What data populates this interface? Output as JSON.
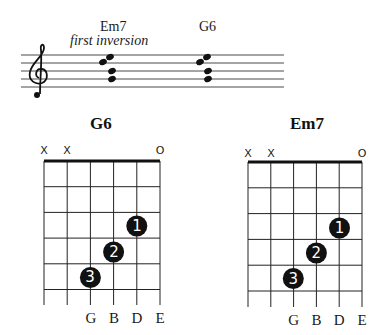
{
  "staff": {
    "chords": [
      {
        "name": "Em7",
        "subtitle": "first inversion",
        "x": 100
      },
      {
        "name": "G6",
        "subtitle": "",
        "x": 199
      }
    ],
    "clef": "treble-clef",
    "line_ys": [
      55,
      63,
      71,
      79,
      87
    ],
    "x_start": 21,
    "x_end": 284
  },
  "diagrams": [
    {
      "title": "G6",
      "left": 44,
      "top": 161,
      "col_width": 23.2,
      "fret_height": 25.7,
      "frets": 5,
      "string_marks": [
        "X",
        "X",
        "",
        "",
        "",
        "O"
      ],
      "fingers": [
        {
          "string": 4,
          "fret": 3,
          "finger": "1"
        },
        {
          "string": 3,
          "fret": 4,
          "finger": "2"
        },
        {
          "string": 2,
          "fret": 5,
          "finger": "3"
        }
      ],
      "string_labels": [
        "",
        "",
        "G",
        "B",
        "D",
        "E"
      ]
    },
    {
      "title": "Em7",
      "left": 248,
      "top": 162,
      "col_width": 22.8,
      "fret_height": 25.8,
      "frets": 5,
      "string_marks": [
        "X",
        "X",
        "",
        "",
        "",
        "O"
      ],
      "fingers": [
        {
          "string": 4,
          "fret": 3,
          "finger": "1"
        },
        {
          "string": 3,
          "fret": 4,
          "finger": "2"
        },
        {
          "string": 2,
          "fret": 5,
          "finger": "3"
        }
      ],
      "string_labels": [
        "",
        "",
        "G",
        "B",
        "D",
        "E"
      ]
    }
  ]
}
